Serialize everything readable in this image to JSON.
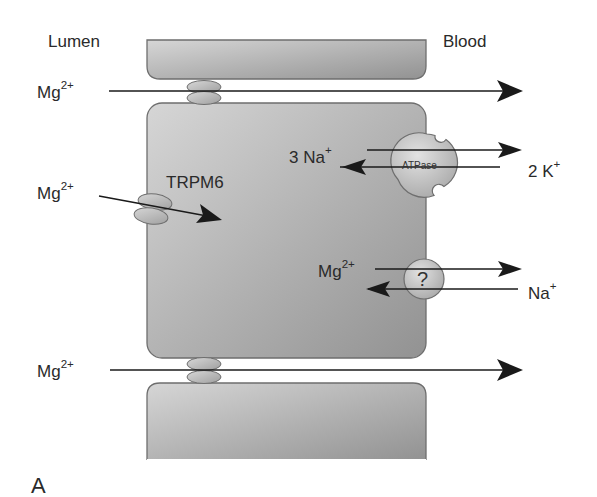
{
  "figure": {
    "panel_label": "A",
    "side_labels": {
      "left": "Lumen",
      "right": "Blood"
    },
    "colors": {
      "cell_fill_light": "#d2d2d2",
      "cell_fill_dark": "#9a9a9a",
      "cell_border": "#6e6e6e",
      "arrow": "#1a1a1a",
      "protein_fill": "#b5b5b5",
      "text": "#2a2a2a"
    },
    "paracellular_top": {
      "ion": "Mg",
      "charge": "2+",
      "direction": "lumen-to-blood"
    },
    "trpm6": {
      "ion": "Mg",
      "charge": "2+",
      "channel_label": "TRPM6",
      "direction": "into-cell"
    },
    "atpase": {
      "label": "ATPase",
      "out_ion": "3 Na",
      "out_charge": "+",
      "in_ion": "2 K",
      "in_charge": "+"
    },
    "exchanger": {
      "label": "?",
      "out_ion": "Mg",
      "out_charge": "2+",
      "in_ion": "Na",
      "in_charge": "+"
    },
    "paracellular_bottom": {
      "ion": "Mg",
      "charge": "2+",
      "direction": "lumen-to-blood"
    }
  }
}
